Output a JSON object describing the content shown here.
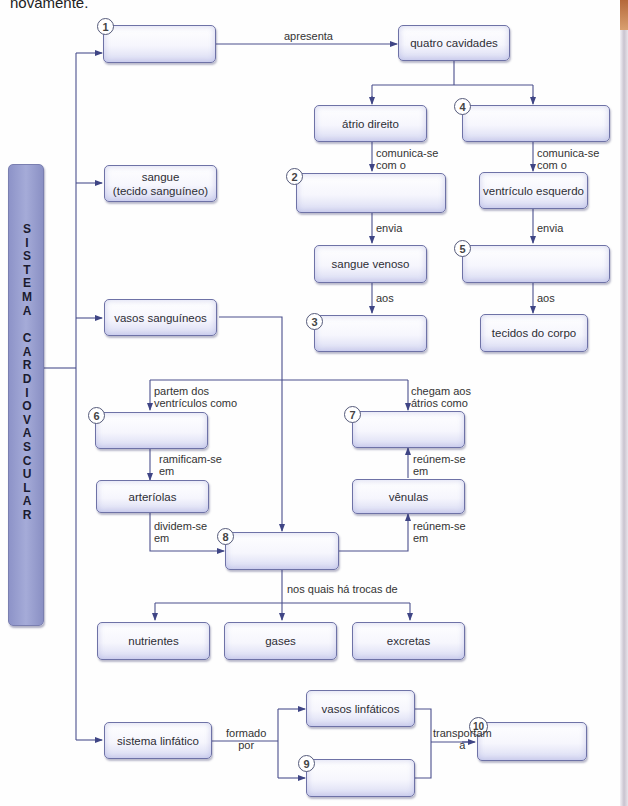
{
  "intro_text": "novamente.",
  "side_title_lines": [
    "SISTEMA",
    "CARDIOVASCULAR"
  ],
  "colors": {
    "line": "#4a4f8c",
    "box_border": "#6e72a6",
    "side_fill": "#9aa0d2"
  },
  "boxes": {
    "b1": {
      "number": "1",
      "text": ""
    },
    "quatro": {
      "text": "quatro cavidades"
    },
    "atrio_direito": {
      "text": "átrio direito"
    },
    "b4": {
      "number": "4",
      "text": ""
    },
    "b2": {
      "number": "2",
      "text": ""
    },
    "ventriculo_esquerdo": {
      "text": "ventrículo esquerdo"
    },
    "sangue_venoso": {
      "text": "sangue venoso"
    },
    "b5": {
      "number": "5",
      "text": ""
    },
    "b3": {
      "number": "3",
      "text": ""
    },
    "tecidos": {
      "text": "tecidos do corpo"
    },
    "sangue": {
      "text": "sangue\n(tecido sanguíneo)"
    },
    "vasos": {
      "text": "vasos sanguíneos"
    },
    "b6": {
      "number": "6",
      "text": ""
    },
    "b7": {
      "number": "7",
      "text": ""
    },
    "arteriolas": {
      "text": "arteríolas"
    },
    "venulas": {
      "text": "vênulas"
    },
    "b8": {
      "number": "8",
      "text": ""
    },
    "nutrientes": {
      "text": "nutrientes"
    },
    "gases": {
      "text": "gases"
    },
    "excretas": {
      "text": "excretas"
    },
    "linfatico": {
      "text": "sistema linfático"
    },
    "vasos_linfaticos": {
      "text": "vasos linfáticos"
    },
    "b9": {
      "number": "9",
      "text": ""
    },
    "b10": {
      "number": "10",
      "text": ""
    }
  },
  "labels": {
    "apresenta": "apresenta",
    "comunica1": "comunica-se\ncom o",
    "comunica2": "comunica-se\ncom o",
    "envia1": "envia",
    "envia2": "envia",
    "aos1": "aos",
    "aos2": "aos",
    "partem": "partem dos\nventrículos como",
    "chegam": "chegam aos\nátrios como",
    "ramificam": "ramificam-se\nem",
    "reunem1": "reúnem-se\nem",
    "dividem": "dividem-se\nem",
    "reunem2": "reúnem-se\nem",
    "trocas": "nos quais há trocas de",
    "formado": "formado\npor",
    "transportam": "transportam\na"
  }
}
